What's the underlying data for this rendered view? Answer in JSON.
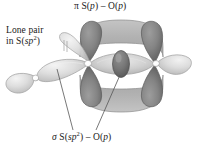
{
  "figure": {
    "title_top": "π S(p) – O(p)",
    "title_bottom": "σ S(sp2) – O(p)",
    "label_lone_pair_line1": "Lone pair",
    "label_lone_pair_line2": "in S(sp2)",
    "background_color": "#ffffff"
  },
  "labels": {
    "pi": {
      "greek": "π",
      "atom1": "S",
      "orbital1": "p",
      "dash": "–",
      "atom2": "O",
      "orbital2": "p",
      "full_text": "π S(p) – O(p)"
    },
    "sigma": {
      "greek": "σ",
      "atom1": "S",
      "orbital1": "sp",
      "orbital1_sup": "2",
      "dash": "–",
      "atom2": "O",
      "orbital2": "p",
      "full_text": "σ S(sp2) – O(p)"
    },
    "lone_pair": {
      "line1": "Lone pair",
      "line2_prefix": "in S(",
      "line2_orbital": "sp",
      "line2_sup": "2",
      "line2_suffix": ")",
      "full_text": "Lone pair in S(sp2)"
    }
  },
  "colors": {
    "pi_lobe_dark": "#7e7e7e",
    "pi_lobe_dark_edge": "#5d5d5d",
    "pi_cloud_band": "#b4b4b4",
    "sigma_lens": "#c9c9c9",
    "sigma_core_dark": "#6f6f6f",
    "lone_pair_light": "#d2d2d2",
    "lone_pair_highlight": "#efefef",
    "node_white": "#ffffff",
    "outline": "#6a6a6a",
    "leader_line": "#555555",
    "text": "#1a1a1a"
  },
  "orbitals": {
    "pi_lobes": [
      {
        "name": "pi-lobe-upper-left",
        "cx": 91,
        "cy": 42,
        "shade": "dark"
      },
      {
        "name": "pi-lobe-upper-right",
        "cx": 152,
        "cy": 42,
        "shade": "dark"
      },
      {
        "name": "pi-lobe-lower-left",
        "cx": 91,
        "cy": 90,
        "shade": "dark"
      },
      {
        "name": "pi-lobe-lower-right",
        "cx": 152,
        "cy": 90,
        "shade": "dark"
      }
    ],
    "pi_clouds": [
      {
        "name": "pi-cloud-top",
        "edge": "top"
      },
      {
        "name": "pi-cloud-bottom",
        "edge": "bottom"
      }
    ],
    "sigma_bond": {
      "name": "sigma-lens",
      "cx": 121,
      "cy": 66
    },
    "sigma_core": {
      "name": "sigma-core-oval",
      "cx": 121,
      "cy": 64
    },
    "lone_pair_orbital": {
      "name": "lone-pair-sp2",
      "large_lobe": {
        "cx": 60,
        "cy": 68
      },
      "small_lobe": {
        "cx": 22,
        "cy": 82
      }
    },
    "nodes": [
      {
        "name": "node-sulfur",
        "cx": 88,
        "cy": 63
      },
      {
        "name": "node-oxygen",
        "cx": 155,
        "cy": 63
      },
      {
        "name": "node-lone-pair",
        "cx": 36,
        "cy": 77
      }
    ],
    "right_lobe": {
      "name": "o-p-lobe-right",
      "cx": 177,
      "cy": 63
    }
  },
  "leaders": [
    {
      "name": "leader-sigma",
      "from_x": 96,
      "from_y": 129,
      "to_x": 120,
      "to_y": 74
    },
    {
      "name": "leader-lone-pair",
      "from_x": 72,
      "from_y": 129,
      "to_x": 57,
      "to_y": 70
    }
  ]
}
